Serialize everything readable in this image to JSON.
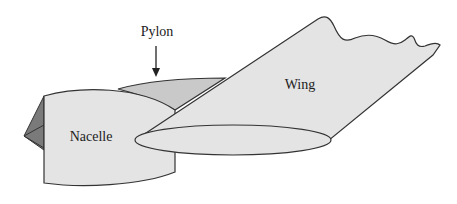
{
  "diagram": {
    "type": "engine-nacelle-pylon-wing illustration",
    "labels": {
      "pylon": "Pylon",
      "wing": "Wing",
      "nacelle": "Nacelle"
    },
    "colors": {
      "fill_light": "#e4e4e4",
      "fill_pylon": "#c9c9c9",
      "fill_cone": "#7a7a7a",
      "stroke": "#333333",
      "background": "#ffffff"
    },
    "components": [
      "nacelle",
      "spinner-cone",
      "pylon",
      "wing",
      "wing-root-airfoil",
      "pylon-arrow"
    ]
  }
}
